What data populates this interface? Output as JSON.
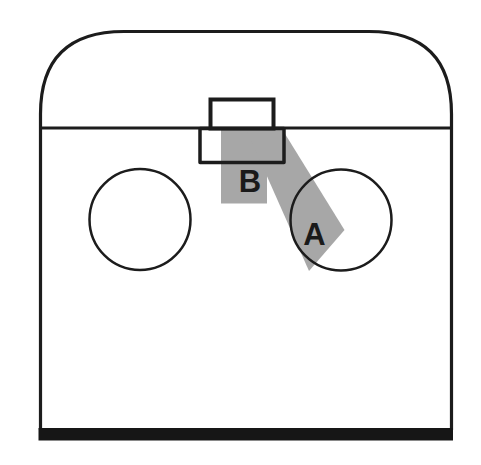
{
  "diagram": {
    "zone_labels": {
      "a": "A",
      "b": "B"
    },
    "colors": {
      "background": "#ffffff",
      "line": "#1c1c1c",
      "zone_fill": "#a7a7a7",
      "end_bar": "#161616",
      "label_text": "#1a1a1a"
    }
  }
}
